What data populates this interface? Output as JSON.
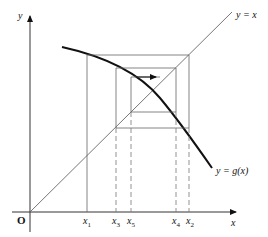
{
  "diagram": {
    "axes": {
      "x_label": "x",
      "y_label": "y",
      "origin_label": "O"
    },
    "curves": [
      {
        "name": "identity-line",
        "label": "y = x"
      },
      {
        "name": "g-curve",
        "label": "y = g(x)"
      }
    ],
    "x_ticks": [
      {
        "label": "x",
        "sub": "1"
      },
      {
        "label": "x",
        "sub": "3"
      },
      {
        "label": "x",
        "sub": "5"
      },
      {
        "label": "x",
        "sub": "4"
      },
      {
        "label": "x",
        "sub": "2"
      }
    ],
    "annotations": {
      "arrow": "direction of iteration"
    },
    "colors": {
      "curve": "#111111",
      "lines": "#555555"
    }
  }
}
